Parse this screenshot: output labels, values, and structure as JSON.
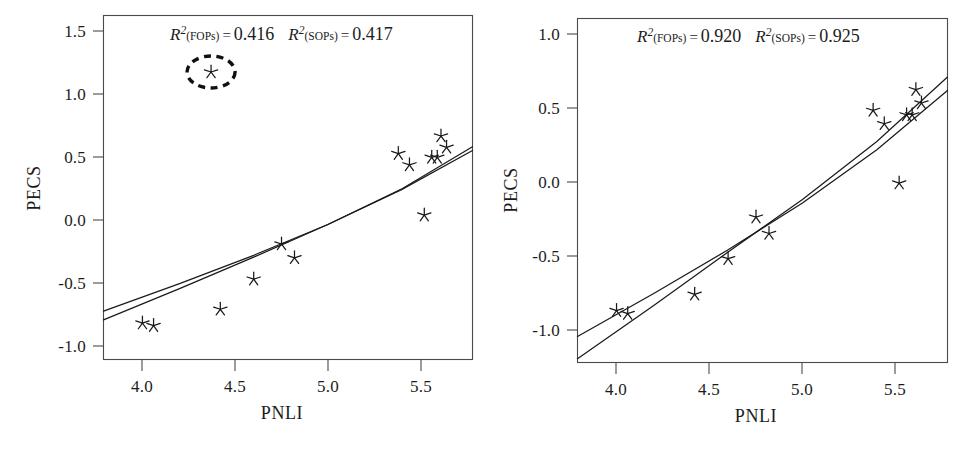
{
  "figure": {
    "panel_count": 2,
    "marker_symbol": "star-asterisk",
    "line_color": "#1a1a1a",
    "frame_color": "#4a4a4a",
    "background": "#ffffff"
  },
  "chart_data": [
    {
      "panel": "left",
      "type": "scatter",
      "title": "",
      "xlabel": "PNLI",
      "ylabel": "PECS",
      "xlim": [
        3.79,
        5.78
      ],
      "ylim": [
        -1.12,
        1.62
      ],
      "xticks": [
        4.0,
        4.5,
        5.0,
        5.5
      ],
      "xticklabels": [
        "4.0",
        "4.5",
        "5.0",
        "5.5"
      ],
      "yticks": [
        1.5,
        1.0,
        0.5,
        0.0,
        -0.5,
        -1.0
      ],
      "yticklabels": [
        "1.5",
        "1.0",
        "0.5",
        "0.0",
        "-0.5",
        "-1.0"
      ],
      "grid": false,
      "legend": "none",
      "annotation": {
        "r2_fops_label": "R",
        "r2_fops_sup": "2",
        "r2_fops_sub": "(FOPs)",
        "r2_fops_eq": "=",
        "r2_fops_value": "0.416",
        "r2_sops_label": "R",
        "r2_sops_sup": "2",
        "r2_sops_sub": "(SOPs)",
        "r2_sops_eq": "=",
        "r2_sops_value": "0.417",
        "full_text": "R2(FOPs) = 0.416   R2(SOPs) = 0.417"
      },
      "points": [
        {
          "x": 4.0,
          "y": -0.83
        },
        {
          "x": 4.06,
          "y": -0.85
        },
        {
          "x": 4.42,
          "y": -0.72
        },
        {
          "x": 4.6,
          "y": -0.48
        },
        {
          "x": 4.75,
          "y": -0.2
        },
        {
          "x": 4.82,
          "y": -0.31
        },
        {
          "x": 5.38,
          "y": 0.52
        },
        {
          "x": 5.44,
          "y": 0.43
        },
        {
          "x": 5.52,
          "y": 0.03
        },
        {
          "x": 5.56,
          "y": 0.49
        },
        {
          "x": 5.59,
          "y": 0.49
        },
        {
          "x": 5.61,
          "y": 0.66
        },
        {
          "x": 5.64,
          "y": 0.57
        }
      ],
      "outlier_points": [
        {
          "x": 4.37,
          "y": 1.17,
          "circled": true
        }
      ],
      "series": [
        {
          "name": "FOPs fit",
          "kind": "line",
          "points": [
            {
              "x": 3.79,
              "y": -0.735
            },
            {
              "x": 4.2,
              "y": -0.515
            },
            {
              "x": 4.6,
              "y": -0.29
            },
            {
              "x": 5.0,
              "y": -0.045
            },
            {
              "x": 5.4,
              "y": 0.235
            },
            {
              "x": 5.78,
              "y": 0.545
            }
          ]
        },
        {
          "name": "SOPs fit",
          "kind": "line",
          "points": [
            {
              "x": 3.79,
              "y": -0.805
            },
            {
              "x": 4.2,
              "y": -0.555
            },
            {
              "x": 4.6,
              "y": -0.305
            },
            {
              "x": 5.0,
              "y": -0.045
            },
            {
              "x": 5.4,
              "y": 0.24
            },
            {
              "x": 5.78,
              "y": 0.575
            }
          ]
        }
      ]
    },
    {
      "panel": "right",
      "type": "scatter",
      "title": "",
      "xlabel": "PNLI",
      "ylabel": "PECS",
      "xlim": [
        3.79,
        5.78
      ],
      "ylim": [
        -1.18,
        1.14
      ],
      "xticks": [
        4.0,
        4.5,
        5.0,
        5.5
      ],
      "xticklabels": [
        "4.0",
        "4.5",
        "5.0",
        "5.5"
      ],
      "yticks": [
        1.0,
        0.5,
        0.0,
        -0.5,
        -1.0
      ],
      "yticklabels": [
        "1.0",
        "0.5",
        "0.0",
        "-0.5",
        "-1.0"
      ],
      "grid": false,
      "legend": "none",
      "annotation": {
        "r2_fops_label": "R",
        "r2_fops_sup": "2",
        "r2_fops_sub": "(FOPs)",
        "r2_fops_eq": "=",
        "r2_fops_value": "0.920",
        "r2_sops_label": "R",
        "r2_sops_sup": "2",
        "r2_sops_sub": "(SOPs)",
        "r2_sops_eq": "=",
        "r2_sops_value": "0.925",
        "full_text": "R2(FOPs) = 0.920   R2(SOPs) = 0.925"
      },
      "points": [
        {
          "x": 4.0,
          "y": -0.83
        },
        {
          "x": 4.06,
          "y": -0.85
        },
        {
          "x": 4.42,
          "y": -0.72
        },
        {
          "x": 4.6,
          "y": -0.48
        },
        {
          "x": 4.75,
          "y": -0.2
        },
        {
          "x": 4.82,
          "y": -0.31
        },
        {
          "x": 5.38,
          "y": 0.52
        },
        {
          "x": 5.44,
          "y": 0.43
        },
        {
          "x": 5.52,
          "y": 0.03
        },
        {
          "x": 5.56,
          "y": 0.49
        },
        {
          "x": 5.59,
          "y": 0.49
        },
        {
          "x": 5.61,
          "y": 0.66
        },
        {
          "x": 5.64,
          "y": 0.57
        }
      ],
      "outlier_points": [],
      "series": [
        {
          "name": "FOPs fit",
          "kind": "line",
          "points": [
            {
              "x": 3.79,
              "y": -1.005
            },
            {
              "x": 4.2,
              "y": -0.715
            },
            {
              "x": 4.6,
              "y": -0.42
            },
            {
              "x": 5.0,
              "y": -0.105
            },
            {
              "x": 5.4,
              "y": 0.255
            },
            {
              "x": 5.78,
              "y": 0.655
            }
          ]
        },
        {
          "name": "SOPs fit",
          "kind": "line",
          "points": [
            {
              "x": 3.79,
              "y": -1.155
            },
            {
              "x": 4.2,
              "y": -0.795
            },
            {
              "x": 4.6,
              "y": -0.435
            },
            {
              "x": 5.0,
              "y": -0.08
            },
            {
              "x": 5.4,
              "y": 0.31
            },
            {
              "x": 5.78,
              "y": 0.745
            }
          ]
        }
      ]
    }
  ]
}
